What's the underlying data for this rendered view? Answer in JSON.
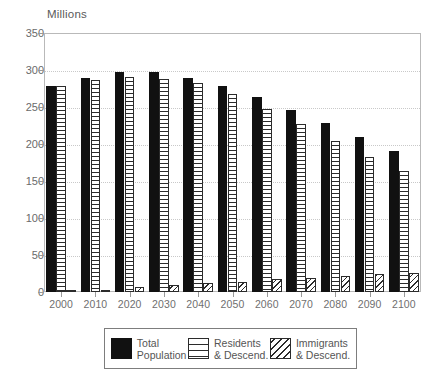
{
  "chart_data": {
    "type": "bar",
    "title": "",
    "subtitle": "",
    "xlabel": "",
    "ylabel": "Millions",
    "unit_label": "Millions",
    "categories": [
      "2000",
      "2010",
      "2020",
      "2030",
      "2040",
      "2050",
      "2060",
      "2070",
      "2080",
      "2090",
      "2100"
    ],
    "ylim": [
      0,
      350
    ],
    "y_ticks": [
      0,
      50,
      100,
      150,
      200,
      250,
      300,
      350
    ],
    "y_tick_labels": [
      "0",
      "50",
      "100",
      "150",
      "200",
      "250",
      "300",
      "350"
    ],
    "grid": true,
    "grid_axis": "y",
    "legend_position": "bottom",
    "series": [
      {
        "name": "Total Population",
        "pattern": "solid",
        "color": "#111111",
        "values": [
          279,
          289,
          297,
          297,
          289,
          279,
          264,
          246,
          228,
          209,
          191
        ]
      },
      {
        "name": "Residents & Descend.",
        "pattern": "horizontal-lines",
        "color": "#2b2b2b",
        "values": [
          278,
          286,
          290,
          288,
          282,
          268,
          247,
          227,
          204,
          183,
          163
        ]
      },
      {
        "name": "Immigrants & Descend.",
        "pattern": "diagonal-lines",
        "color": "#2b2b2b",
        "values": [
          1,
          3,
          7,
          9,
          12,
          14,
          17,
          19,
          21,
          24,
          26
        ]
      }
    ]
  },
  "legend": {
    "items": [
      {
        "line1": "Total",
        "line2": "Population",
        "swatch": "solid-black-swatch"
      },
      {
        "line1": "Residents",
        "line2": "& Descend.",
        "swatch": "horizontal-hatch-swatch"
      },
      {
        "line1": "Immigrants",
        "line2": "& Descend.",
        "swatch": "diagonal-hatch-swatch"
      }
    ]
  }
}
